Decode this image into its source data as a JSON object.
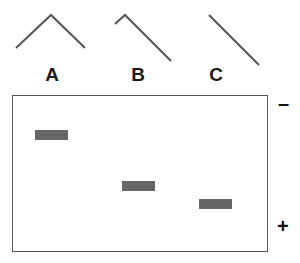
{
  "diagram": {
    "molecules": [
      {
        "label": "A",
        "shape": "inverted-v-symmetric"
      },
      {
        "label": "B",
        "shape": "short-hook-long-arm"
      },
      {
        "label": "C",
        "shape": "straight-line"
      }
    ],
    "gel": {
      "negative_pole": "–",
      "positive_pole": "+",
      "bands": [
        {
          "lane": "A",
          "relative_migration": 0.22
        },
        {
          "lane": "B",
          "relative_migration": 0.55
        },
        {
          "lane": "C",
          "relative_migration": 0.67
        }
      ]
    },
    "colors": {
      "line": "#555555",
      "band": "#666666",
      "border": "#555555"
    }
  }
}
